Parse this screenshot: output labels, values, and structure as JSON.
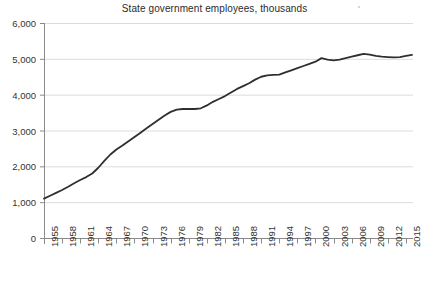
{
  "chart_data": {
    "type": "line",
    "title": "State government employees, thousands",
    "xlabel": "",
    "ylabel": "",
    "ylim": [
      0,
      6000
    ],
    "ytick_labels": [
      "0",
      "1,000",
      "2,000",
      "3,000",
      "4,000",
      "5,000",
      "6,000"
    ],
    "ytick_values": [
      0,
      1000,
      2000,
      3000,
      4000,
      5000,
      6000
    ],
    "grid": "horizontal",
    "legend": "none",
    "xlim": [
      1955,
      2016
    ],
    "xtick_labels": [
      "1955",
      "1958",
      "1961",
      "1964",
      "1967",
      "1970",
      "1973",
      "1976",
      "1979",
      "1982",
      "1985",
      "1988",
      "1991",
      "1994",
      "1997",
      "2000",
      "2003",
      "2006",
      "2009",
      "2012",
      "2015"
    ],
    "xtick_values": [
      1955,
      1958,
      1961,
      1964,
      1967,
      1970,
      1973,
      1976,
      1979,
      1982,
      1985,
      1988,
      1991,
      1994,
      1997,
      2000,
      2003,
      2006,
      2009,
      2012,
      2015
    ],
    "series": [
      {
        "name": "State government employees",
        "color": "#2f2f2f",
        "x": [
          1955,
          1956,
          1957,
          1958,
          1959,
          1960,
          1961,
          1962,
          1963,
          1964,
          1965,
          1966,
          1967,
          1968,
          1969,
          1970,
          1971,
          1972,
          1973,
          1974,
          1975,
          1976,
          1977,
          1978,
          1979,
          1980,
          1981,
          1982,
          1983,
          1984,
          1985,
          1986,
          1987,
          1988,
          1989,
          1990,
          1991,
          1992,
          1993,
          1994,
          1995,
          1996,
          1997,
          1998,
          1999,
          2000,
          2001,
          2002,
          2003,
          2004,
          2005,
          2006,
          2007,
          2008,
          2009,
          2010,
          2011,
          2012,
          2013,
          2014,
          2015,
          2016
        ],
        "values": [
          1100,
          1180,
          1260,
          1340,
          1430,
          1530,
          1620,
          1700,
          1800,
          1960,
          2150,
          2330,
          2470,
          2580,
          2700,
          2820,
          2940,
          3060,
          3180,
          3300,
          3420,
          3520,
          3580,
          3600,
          3600,
          3600,
          3620,
          3700,
          3800,
          3880,
          3960,
          4060,
          4160,
          4240,
          4320,
          4420,
          4500,
          4540,
          4550,
          4560,
          4620,
          4680,
          4740,
          4800,
          4860,
          4920,
          5020,
          4980,
          4960,
          4980,
          5020,
          5060,
          5100,
          5140,
          5120,
          5080,
          5060,
          5050,
          5040,
          5050,
          5080,
          5110
        ]
      }
    ]
  },
  "axes": {
    "plot_left_px": 44,
    "plot_right_px": 412,
    "plot_top_px": 23,
    "plot_bottom_px": 238
  }
}
